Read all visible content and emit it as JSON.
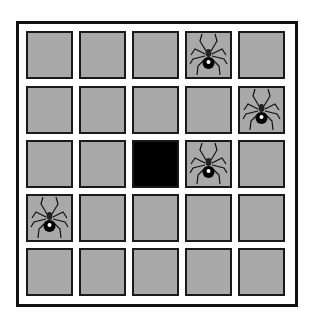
{
  "game": {
    "grid_size": 5,
    "colors": {
      "cell": "#a9a9a9",
      "dark": "#000000",
      "border": "#1a1a1a"
    },
    "cells": [
      [
        "empty",
        "empty",
        "empty",
        "spider",
        "empty"
      ],
      [
        "empty",
        "empty",
        "empty",
        "empty",
        "spider"
      ],
      [
        "empty",
        "empty",
        "dark",
        "spider",
        "empty"
      ],
      [
        "spider",
        "empty",
        "empty",
        "empty",
        "empty"
      ],
      [
        "empty",
        "empty",
        "empty",
        "empty",
        "empty"
      ]
    ]
  }
}
